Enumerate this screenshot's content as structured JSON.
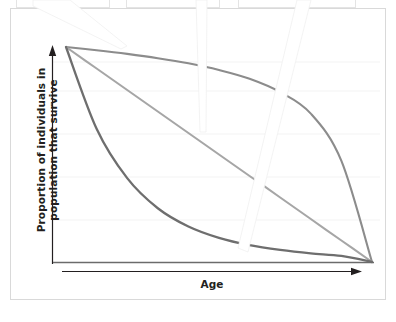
{
  "figure": {
    "name": "survivorship-curves-figure",
    "background_color": "#ffffff",
    "frame_color": "#d9d9d9"
  },
  "axes": {
    "x_label": "Age",
    "y_label_line_1": "Proportion of individuals in",
    "y_label_line_2": "population that survive",
    "axis_color": "#231f20",
    "gridline_color": "#f2f2f2"
  },
  "callouts": [
    {
      "name": "callout-box-left",
      "label": ""
    },
    {
      "name": "callout-box-middle",
      "label": ""
    },
    {
      "name": "callout-box-right",
      "label": ""
    }
  ],
  "chart_data": {
    "type": "line",
    "title": "",
    "subtitle": "",
    "xlabel": "Age",
    "ylabel": "Proportion of individuals in population that survive",
    "xlim": [
      0,
      1
    ],
    "ylim": [
      0,
      1
    ],
    "x_tick_labels": [],
    "y_tick_labels": [],
    "grid": true,
    "gridlines_y": [
      0.2,
      0.4,
      0.6,
      0.8
    ],
    "legend": "none",
    "annotations": [
      "Type I curve: high survivorship until old age, then steep drop",
      "Type II curve: constant rate of decline (straight diagonal)",
      "Type III curve: steep early mortality, then leveling off"
    ],
    "x": [
      0.0,
      0.1,
      0.2,
      0.3,
      0.4,
      0.5,
      0.6,
      0.7,
      0.8,
      0.9,
      1.0
    ],
    "series": [
      {
        "name": "Type I",
        "color": "#8c8c8c",
        "values": [
          1.0,
          0.985,
          0.968,
          0.948,
          0.924,
          0.893,
          0.852,
          0.79,
          0.69,
          0.47,
          0.0
        ]
      },
      {
        "name": "Type II",
        "color": "#a6a6a6",
        "values": [
          1.0,
          0.9,
          0.8,
          0.7,
          0.6,
          0.5,
          0.4,
          0.3,
          0.2,
          0.1,
          0.0
        ]
      },
      {
        "name": "Type III",
        "color": "#6e6e6e",
        "values": [
          1.0,
          0.62,
          0.39,
          0.25,
          0.165,
          0.112,
          0.078,
          0.056,
          0.04,
          0.028,
          0.0
        ]
      }
    ]
  }
}
